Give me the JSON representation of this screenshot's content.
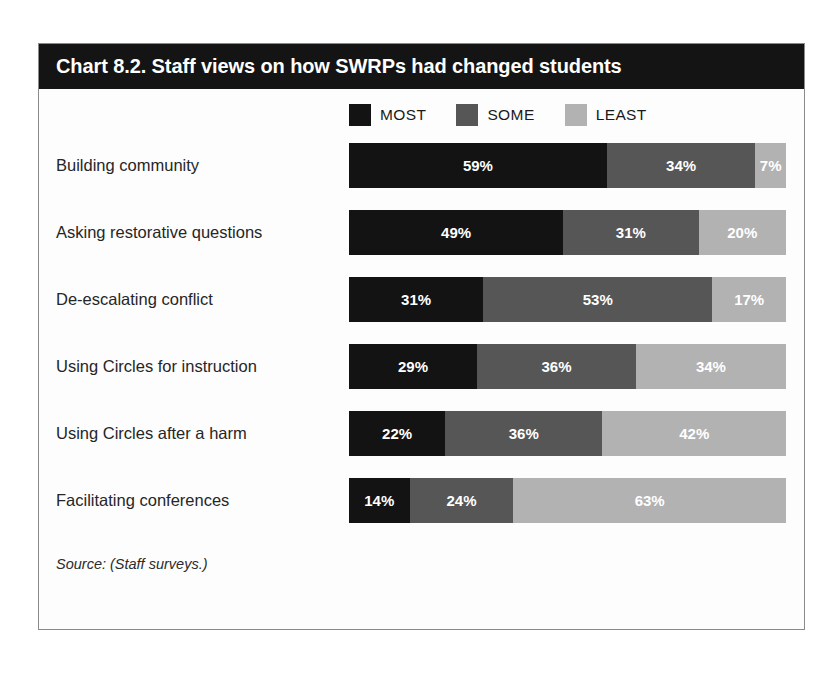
{
  "chart_data": {
    "type": "bar",
    "subtype": "stacked-horizontal-100",
    "title": "Chart 8.2. Staff views on how SWRPs had changed students",
    "xlabel": "",
    "ylabel": "",
    "xlim": [
      0,
      100
    ],
    "grid": false,
    "legend_position": "top",
    "value_suffix": "%",
    "categories": [
      "Building community",
      "Asking restorative questions",
      "De-escalating conflict",
      "Using Circles for instruction",
      "Using Circles after a harm",
      "Facilitating conferences"
    ],
    "series": [
      {
        "name": "MOST",
        "color": "#131313",
        "values": [
          59,
          49,
          31,
          29,
          22,
          14
        ]
      },
      {
        "name": "SOME",
        "color": "#565656",
        "values": [
          34,
          31,
          53,
          36,
          36,
          24
        ]
      },
      {
        "name": "LEAST",
        "color": "#b2b2b2",
        "values": [
          7,
          20,
          17,
          34,
          42,
          63
        ]
      }
    ],
    "data_labels": [
      [
        "59%",
        "34%",
        "7%"
      ],
      [
        "49%",
        "31%",
        "20%"
      ],
      [
        "31%",
        "53%",
        "17%"
      ],
      [
        "29%",
        "36%",
        "34%"
      ],
      [
        "22%",
        "36%",
        "42%"
      ],
      [
        "14%",
        "24%",
        "63%"
      ]
    ],
    "source": "Source: (Staff surveys.)"
  },
  "legend": [
    {
      "label": "MOST",
      "color": "#131313"
    },
    {
      "label": "SOME",
      "color": "#565656"
    },
    {
      "label": "LEAST",
      "color": "#b2b2b2"
    }
  ],
  "colors": {
    "title_bar_bg": "#141414",
    "title_text": "#ffffff",
    "card_border": "#8a8a8a",
    "card_bg": "#fdfdfd",
    "label_text": "#262626"
  }
}
